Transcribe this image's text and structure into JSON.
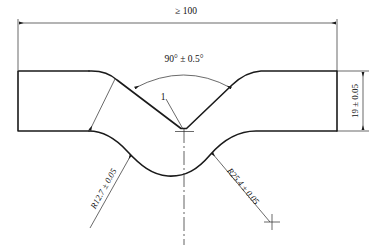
{
  "drawing": {
    "title": "S-bend sheet metal profile engineering drawing",
    "line_color": "#1a1a1a",
    "thin_line_color": "#2a2a2a",
    "background": "#ffffff"
  },
  "dimensions": {
    "overall_length": {
      "label": "≥ 100",
      "name": "overall-length-dimension",
      "orientation": "horizontal",
      "position": "top"
    },
    "height": {
      "label": "19 ± 0.05",
      "name": "height-dimension",
      "orientation": "vertical",
      "position": "right"
    },
    "angle": {
      "label": "90° ± 0.5°",
      "name": "angle-dimension",
      "position": "top-center"
    },
    "radius_left": {
      "label": "R12.7 ± 0.05",
      "name": "left-radius-dimension",
      "position": "lower-left"
    },
    "radius_right": {
      "label": "R25.4 ± 0.05",
      "name": "right-radius-dimension",
      "position": "lower-right"
    },
    "item_callout": {
      "label": "1",
      "name": "item-callout-1",
      "position": "center"
    }
  },
  "geometry": {
    "left_block": {
      "x": 18,
      "y": 71,
      "width": 71,
      "height": 60
    },
    "right_block": {
      "x": 260,
      "y": 71,
      "width": 77,
      "height": 60
    },
    "center_vertex": {
      "x": 184,
      "y": 131
    },
    "top_edge_y": 71,
    "bottom_edge_y": 131,
    "trough_y": 176,
    "centerline": {
      "x": 184,
      "y_top": 131,
      "y_bottom": 245
    },
    "dim_line_y": 23,
    "dim_line_x_left": 18,
    "dim_line_x_right": 337,
    "vert_dim_x": 363
  }
}
